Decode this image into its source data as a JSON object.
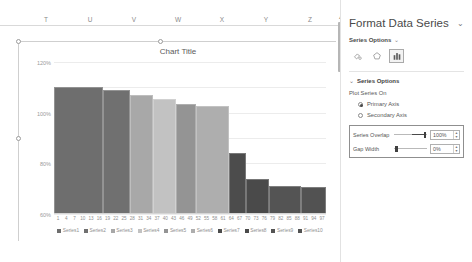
{
  "worksheet": {
    "column_headers": [
      "T",
      "U",
      "V",
      "W",
      "X",
      "Y",
      "Z"
    ],
    "scrollbar": {
      "up_arrow": "▲"
    }
  },
  "chart": {
    "title": "Chart Title"
  },
  "chart_data": {
    "type": "bar",
    "title": "Chart Title",
    "xlabel": "",
    "ylabel": "",
    "ylim": [
      0,
      1.2
    ],
    "grid": true,
    "legend_position": "bottom",
    "y_ticks": [
      "0%",
      "20%",
      "40%",
      "60%",
      "80%",
      "100%",
      "120%"
    ],
    "y_tick_values": [
      0,
      0.2,
      0.4,
      0.6,
      0.8,
      1.0,
      1.2
    ],
    "x_tick_labels": [
      "1",
      "4",
      "7",
      "10",
      "13",
      "16",
      "19",
      "22",
      "25",
      "28",
      "31",
      "34",
      "37",
      "40",
      "43",
      "46",
      "49",
      "52",
      "55",
      "58",
      "61",
      "64",
      "67",
      "70",
      "73",
      "76",
      "79",
      "82",
      "85",
      "88",
      "91",
      "94",
      "97"
    ],
    "categories": [
      "Series1",
      "Series2",
      "Series3",
      "Series4",
      "Series5",
      "Series6",
      "Series7",
      "Series8",
      "Series9",
      "Series10"
    ],
    "values": [
      1.0,
      0.98,
      0.94,
      0.91,
      0.87,
      0.85,
      0.48,
      0.28,
      0.22,
      0.21
    ],
    "colors": [
      "#6e6e6e",
      "#707070",
      "#a8a8a8",
      "#c2c2c2",
      "#949494",
      "#aeaeae",
      "#4c4c4c",
      "#4a4a4a",
      "#545454",
      "#525252"
    ],
    "widths": [
      59,
      32,
      28,
      28,
      24,
      40,
      20,
      28,
      38,
      30
    ],
    "series": [
      {
        "name": "Series1",
        "value": 1.0
      },
      {
        "name": "Series2",
        "value": 0.98
      },
      {
        "name": "Series3",
        "value": 0.94
      },
      {
        "name": "Series4",
        "value": 0.91
      },
      {
        "name": "Series5",
        "value": 0.87
      },
      {
        "name": "Series6",
        "value": 0.85
      },
      {
        "name": "Series7",
        "value": 0.48
      },
      {
        "name": "Series8",
        "value": 0.28
      },
      {
        "name": "Series9",
        "value": 0.22
      },
      {
        "name": "Series10",
        "value": 0.21
      }
    ]
  },
  "pane": {
    "title": "Format Data Series",
    "collapse_icon": "⌄",
    "subtitle": "Series Options",
    "subtitle_caret": "⌄",
    "icons": [
      {
        "name": "fill-line-icon",
        "selected": false
      },
      {
        "name": "effects-icon",
        "selected": false
      },
      {
        "name": "series-options-icon",
        "selected": true
      }
    ],
    "section": {
      "caret": "⌄",
      "heading": "Series Options",
      "plot_series_on_label": "Plot Series On",
      "options": [
        {
          "label": "Primary Axis",
          "selected": true
        },
        {
          "label": "Secondary Axis",
          "selected": false
        }
      ],
      "sliders": [
        {
          "label": "Series Overlap",
          "value": "100%",
          "percent": 100
        },
        {
          "label": "Gap Width",
          "value": "0%",
          "percent": 0
        }
      ],
      "spinner_up": "▲",
      "spinner_down": "▼"
    }
  }
}
